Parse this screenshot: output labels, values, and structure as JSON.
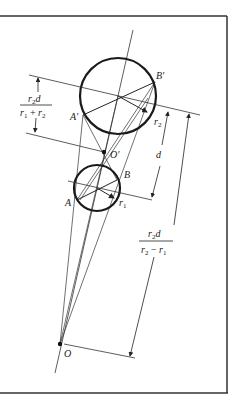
{
  "figure": {
    "frame": {
      "color": "#333333"
    },
    "colors": {
      "ink": "#222222",
      "circle": "#1a1a1a",
      "background": "#ffffff"
    },
    "points": {
      "O": "O",
      "O_prime": "O′",
      "A": "A",
      "B": "B",
      "A_prime": "A′",
      "B_prime": "B′"
    },
    "radii": {
      "r1": "r",
      "r1_sub": "1",
      "r2": "r",
      "r2_sub": "2"
    },
    "dimensions": {
      "d": "d",
      "left_fraction": {
        "numerator_r": "r",
        "numerator_sub": "2",
        "numerator_d": "d",
        "denominator_r1": "r",
        "denominator_r1_sub": "1",
        "denominator_op": " + ",
        "denominator_r2": "r",
        "denominator_r2_sub": "2"
      },
      "right_fraction": {
        "numerator_r": "r",
        "numerator_sub": "2",
        "numerator_d": "d",
        "denominator_r2": "r",
        "denominator_r2_sub": "2",
        "denominator_op": " − ",
        "denominator_r1": "r",
        "denominator_r1_sub": "1"
      }
    }
  }
}
